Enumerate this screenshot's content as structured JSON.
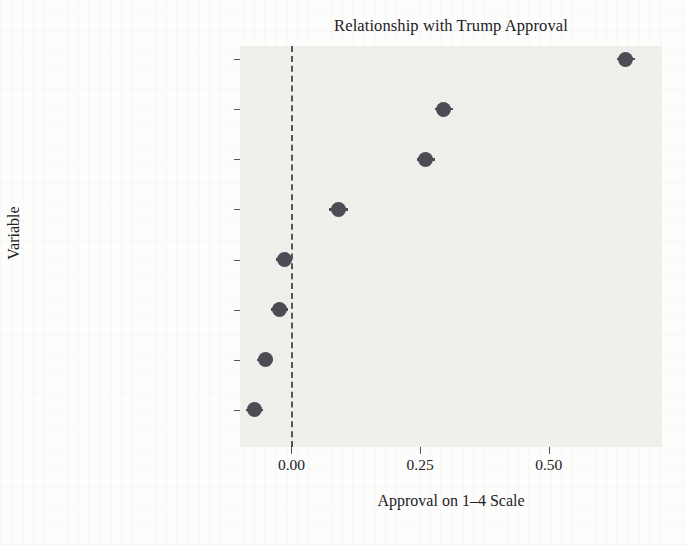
{
  "chart_data": {
    "type": "scatter",
    "title": "Relationship with Trump Approval",
    "xlabel": "Approval on 1–4 Scale",
    "ylabel": "Variable",
    "xlim": [
      -0.1,
      0.72
    ],
    "xticks": [
      0.0,
      0.25,
      0.5
    ],
    "xticklabels": [
      "0.00",
      "0.25",
      "0.50"
    ],
    "grid": false,
    "legend": null,
    "reference_line": {
      "value": 0.0,
      "style": "dashed",
      "color": "#55565c"
    },
    "categories": [
      "PartyID",
      "Racial_Deservingness",
      "ConsumerScale",
      "Age",
      "Race_white",
      "Income",
      "Education",
      "Gender_Female"
    ],
    "values": [
      0.65,
      0.296,
      0.261,
      0.091,
      -0.014,
      -0.023,
      -0.051,
      -0.072
    ],
    "errors": [
      0.018,
      0.018,
      0.018,
      0.018,
      0.016,
      0.016,
      0.016,
      0.016
    ],
    "point_color": "#4c4c55",
    "panel_color": "#e8e6e2"
  }
}
